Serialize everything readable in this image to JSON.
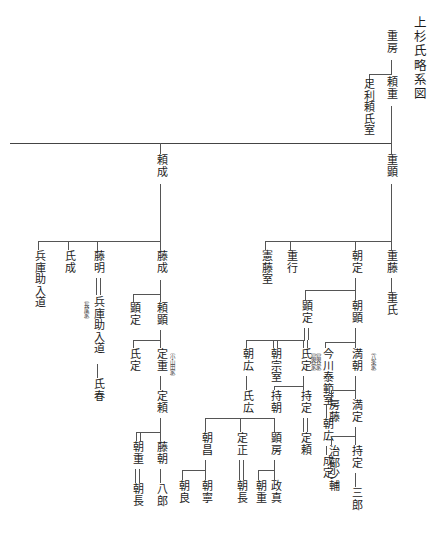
{
  "document": {
    "title": "上杉氏略系図",
    "script_direction": "vertical-rtl",
    "type": "genealogy-chart"
  },
  "nodes": {
    "title": "上杉氏略系図",
    "shigefusa": "重房",
    "yorishige": "頼重",
    "ashikaga_yorishi_shitsu": "足利頼氏室",
    "yorinari": "頼成",
    "shigeaki": "重顕",
    "fujinari": "藤成",
    "kenfuji_shitsu": "憲藤室",
    "shigeyuki": "重行",
    "tomosada_top": "朝定",
    "shigefuji": "重藤",
    "hyogonosuke_nyudo_left": "兵庫助入道",
    "ujinari": "氏成",
    "fujiaki": "藤明",
    "nagao_ke": "〔長尾家〕",
    "hyogonosuke_nyudo_2": "兵庫助入道",
    "ujiharu": "氏春",
    "akisada_left": "顕定",
    "yoriaki": "頼顕",
    "sadashige": "定重",
    "oyamada_ke": "〔小山田家〕",
    "tomoaki": "朝顕",
    "ujishige": "氏氏",
    "akisada_mid": "顕定",
    "tomohiro_upper": "朝広",
    "tomomune_shitsu": "朝宗室",
    "ujisada": "氏定",
    "ogigayatsu_ke": "〔扇谷家〕",
    "imagawa_yasunori_shitsu": "今川泰範室",
    "mitsutomo": "満朝",
    "hachijo_ke": "〔八条家〕",
    "sadayori": "定頼",
    "ujihiro": "氏広",
    "mochitomo": "持朝",
    "mochisada": "持定",
    "tomohiro_lower": "朝広",
    "fusafuji": "房藤",
    "mitsusada": "満定",
    "tomoshige_left": "朝重",
    "fujitomo": "藤朝",
    "tomomasa": "朝昌",
    "sadamasa": "定正",
    "akifusa": "顕房",
    "narisada": "成定",
    "jibunoshoyu": "治部少輔",
    "mochisada2": "持定",
    "sadayori2": "定頼",
    "tomonaga_left": "朝長",
    "hachiro": "八郎",
    "tomoyoshi": "朝良",
    "tomoyasu": "朝寧",
    "tomonaga_mid": "朝長",
    "tomoshige_right": "朝重",
    "masazane": "政真",
    "saburo": "三郎",
    "uji_shi": "重氏"
  },
  "colors": {
    "ink": "#1c1c1c",
    "rule": "#555555",
    "background": "#ffffff"
  }
}
